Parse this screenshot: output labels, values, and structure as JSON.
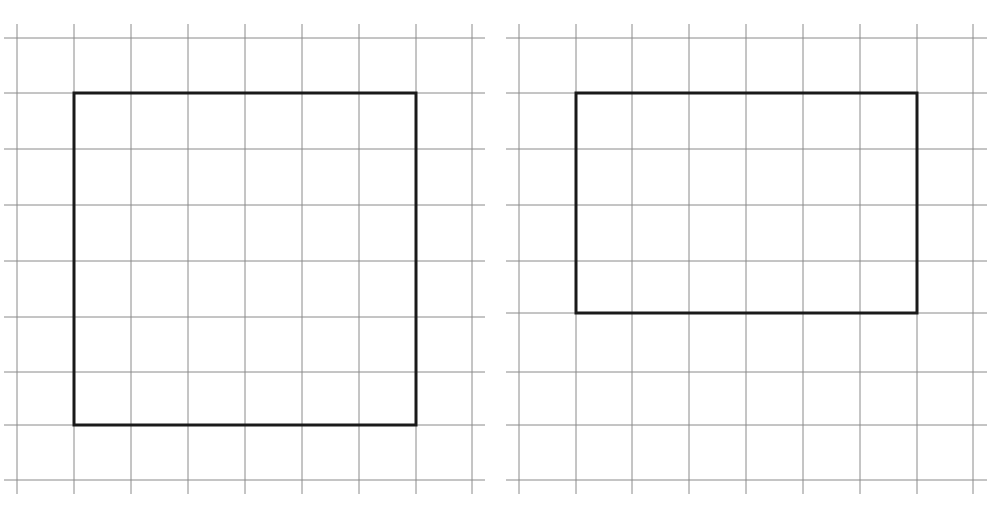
{
  "title": {
    "text": "…p… …y",
    "note": "Title text is cropped at the top edge; only descenders of 'p' and 'y' are visible"
  },
  "colors": {
    "background": "#ffffff",
    "grid": "#8a8a8a",
    "shape_outline": "#1a1a1a"
  },
  "panels": [
    {
      "id": "left",
      "grid": {
        "vertical_x": [
          17,
          74,
          131,
          188,
          245,
          302,
          359,
          416,
          472
        ],
        "horizontal_y": [
          38,
          93,
          149,
          205,
          261,
          317,
          372,
          425,
          480
        ],
        "line_x_range": [
          4,
          485
        ],
        "line_y_range": [
          24,
          494
        ]
      },
      "shape": {
        "type": "rectangle",
        "label": "square",
        "x": 74,
        "y": 93,
        "width": 342,
        "height": 332,
        "grid_units": {
          "cols": 6,
          "rows": 6
        }
      }
    },
    {
      "id": "right",
      "grid": {
        "vertical_x": [
          519,
          576,
          632,
          689,
          746,
          803,
          860,
          917,
          973
        ],
        "horizontal_y": [
          38,
          93,
          149,
          205,
          261,
          313,
          372,
          425,
          480
        ],
        "line_x_range": [
          506,
          987
        ],
        "line_y_range": [
          24,
          494
        ]
      },
      "shape": {
        "type": "rectangle",
        "label": "rectangle",
        "x": 576,
        "y": 93,
        "width": 341,
        "height": 220,
        "grid_units": {
          "cols": 6,
          "rows": 4
        }
      }
    }
  ]
}
